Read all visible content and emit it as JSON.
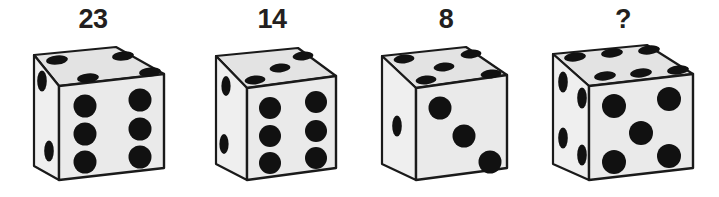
{
  "puzzle": {
    "type": "dice-sequence-puzzle",
    "background_color": "#ffffff",
    "face_color": "#eaeaea",
    "top_face_color": "#e3e3e3",
    "left_face_color": "#efefef",
    "pip_color": "#111111",
    "edge_color": "#1a1a1a",
    "label_color": "#231f20"
  },
  "dice": [
    {
      "label": "23",
      "front_pips": 6,
      "top_pips": 4,
      "left_pips": 2,
      "total": 12
    },
    {
      "label": "14",
      "front_pips": 6,
      "top_pips": 3,
      "left_pips": 2,
      "total": 11
    },
    {
      "label": "8",
      "front_pips": 3,
      "top_pips": 5,
      "left_pips": 1,
      "total": 9
    },
    {
      "label": "?",
      "front_pips": 5,
      "top_pips": 6,
      "left_pips": 4,
      "total": 15
    }
  ]
}
